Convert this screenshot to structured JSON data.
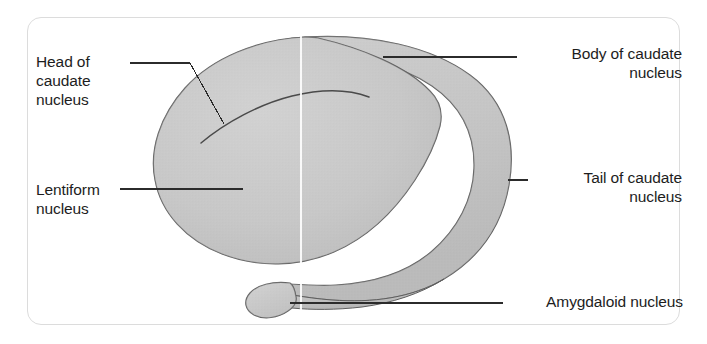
{
  "figure": {
    "background_color": "#ffffff",
    "card_border_color": "#dcdcdc",
    "structure_fill_color": "#c9c9c9",
    "structure_outline_color": "#5a5a5a",
    "leader_line_color": "#2b2b2b",
    "midline_color": "#ffffff",
    "text_color": "#1d1d1d"
  },
  "labels": {
    "head_of_caudate": "Head of\ncaudate\nnucleus",
    "lentiform": "Lentiform\nnucleus",
    "body_of_caudate": "Body of caudate\nnucleus",
    "tail_of_caudate": "Tail of caudate\nnucleus",
    "amygdaloid": "Amygdaloid nucleus"
  },
  "annotations": [
    {
      "name": "head-of-caudate-nucleus",
      "text": "Head of caudate nucleus",
      "align": "left",
      "leader": "horizontal-then-diagonal",
      "target_structure": "head of caudate nucleus"
    },
    {
      "name": "lentiform-nucleus",
      "text": "Lentiform nucleus",
      "align": "left",
      "leader": "horizontal",
      "target_structure": "lentiform nucleus"
    },
    {
      "name": "body-of-caudate-nucleus",
      "text": "Body of caudate nucleus",
      "align": "right",
      "leader": "horizontal",
      "target_structure": "body of caudate nucleus"
    },
    {
      "name": "tail-of-caudate-nucleus",
      "text": "Tail of caudate nucleus",
      "align": "right",
      "leader": "short-horizontal",
      "target_structure": "tail of caudate nucleus"
    },
    {
      "name": "amygdaloid-nucleus",
      "text": "Amygdaloid nucleus",
      "align": "right",
      "leader": "long-horizontal",
      "target_structure": "amygdaloid nucleus"
    }
  ],
  "structures": [
    {
      "name": "lentiform-and-caudate-mass",
      "description": "Large ovoid shaded mass forming the head of the caudate nucleus and the lentiform nucleus"
    },
    {
      "name": "caudate-arc",
      "description": "Shaded arc sweeping over and around the mass forming the body and tail of the caudate nucleus"
    },
    {
      "name": "amygdaloid-bulb",
      "description": "Rounded bulb at the anterior end of the tapering caudate tail"
    },
    {
      "name": "internal-groove-line",
      "description": "Curved line inside the mass separating head of caudate from lentiform nucleus"
    },
    {
      "name": "midline-marker",
      "description": "Faint vertical white line crossing the figure"
    }
  ]
}
